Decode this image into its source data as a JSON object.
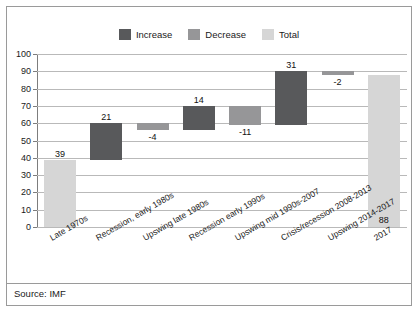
{
  "figure": {
    "source_note": "Source: IMF"
  },
  "legend": {
    "position": "top-center",
    "items": [
      {
        "label": "Increase",
        "color": "#58595b"
      },
      {
        "label": "Decrease",
        "color": "#969698"
      },
      {
        "label": "Total",
        "color": "#d6d6d6"
      }
    ]
  },
  "chart_data": {
    "type": "bar",
    "subtype": "waterfall",
    "title": "",
    "subtitle": "",
    "xlabel": "",
    "ylabel": "",
    "ylim": [
      0,
      100
    ],
    "ytick_step": 10,
    "yticks": [
      "100",
      "90",
      "80",
      "70",
      "60",
      "50",
      "40",
      "30",
      "20",
      "10",
      "0"
    ],
    "grid": true,
    "grid_axis": "y",
    "legend_position": "top-center",
    "categories": [
      "Late 1970s",
      "Recession, early 1980s",
      "Upswing late 1980s",
      "Recession early 1990s",
      "Upswing mid 1990s-2007",
      "Crisis/recession 2008-2013",
      "Upswing 2014-2017",
      "2017"
    ],
    "values": [
      39,
      21,
      -4,
      14,
      -11,
      31,
      -2,
      88
    ],
    "value_labels": [
      "39",
      "21",
      "-4",
      "14",
      "-11",
      "31",
      "-2",
      "88"
    ],
    "kinds": [
      "total",
      "increase",
      "decrease",
      "increase",
      "decrease",
      "increase",
      "decrease",
      "total"
    ],
    "bar_bases": [
      0,
      39,
      56,
      56,
      59,
      59,
      88,
      0
    ],
    "bar_tops": [
      39,
      60,
      60,
      70,
      70,
      90,
      90,
      88
    ],
    "colors": {
      "increase": "#58595b",
      "decrease": "#969698",
      "total": "#d6d6d6"
    },
    "label_placement": [
      "above",
      "above",
      "below",
      "above",
      "below",
      "above",
      "below",
      "inside-bottom"
    ]
  }
}
